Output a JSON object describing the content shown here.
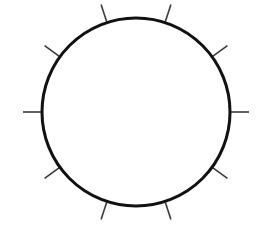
{
  "canvas": {
    "width": 265,
    "height": 235,
    "background_color": "#ffffff"
  },
  "figure": {
    "name": "circle-with-radial-ticks"
  },
  "chart_data": {
    "type": "scatter",
    "title": "",
    "subtitle": "",
    "xlabel": "",
    "ylabel": "",
    "grid": false,
    "legend": null,
    "annotations": [],
    "shapes": [
      {
        "kind": "circle",
        "center_x": 136,
        "center_y": 112,
        "radius": 94,
        "stroke_color": "#111111",
        "stroke_width": 3,
        "fill": "none"
      }
    ],
    "tick_marks": {
      "count": 10,
      "spacing_degrees": 36,
      "offset_degrees": 18,
      "length": 19,
      "direction": "outward",
      "stroke_color": "#3a3a3a",
      "stroke_width": 1.6,
      "angles_degrees": [
        18,
        54,
        90,
        126,
        162,
        198,
        234,
        270,
        306,
        342
      ]
    }
  }
}
